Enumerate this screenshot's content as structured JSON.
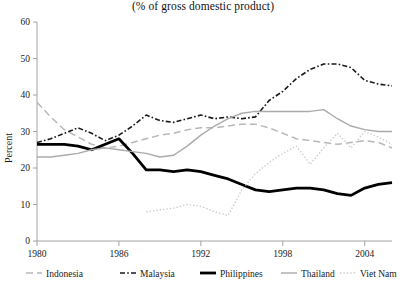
{
  "chart": {
    "title": "(% of gross domestic product)",
    "ylabel": "Percent"
  },
  "axes": {
    "y_ticks": [
      "0",
      "10",
      "20",
      "30",
      "40",
      "50",
      "60"
    ],
    "x_ticks": [
      "1980",
      "1986",
      "1992",
      "1998",
      "2004"
    ]
  },
  "legend": {
    "items": [
      {
        "label": "Indonesia",
        "key": "indonesia"
      },
      {
        "label": "Malaysia",
        "key": "malaysia"
      },
      {
        "label": "Philippines",
        "key": "philippines"
      },
      {
        "label": "Thailand",
        "key": "thailand"
      },
      {
        "label": "Viet Nam",
        "key": "vietnam"
      }
    ]
  },
  "chart_data": {
    "type": "line",
    "title": "(% of gross domestic product)",
    "xlabel": "",
    "ylabel": "Percent",
    "xlim": [
      1980,
      2006
    ],
    "ylim": [
      0,
      60
    ],
    "grid": false,
    "legend_position": "bottom",
    "x": [
      1980,
      1981,
      1982,
      1983,
      1984,
      1985,
      1986,
      1987,
      1988,
      1989,
      1990,
      1991,
      1992,
      1993,
      1994,
      1995,
      1996,
      1997,
      1998,
      1999,
      2000,
      2001,
      2002,
      2003,
      2004,
      2005,
      2006
    ],
    "series": [
      {
        "name": "Indonesia",
        "color": "#b8b8b8",
        "style": "dashed",
        "width": 1.5,
        "values": [
          38.0,
          34.0,
          30.5,
          28.5,
          26.5,
          25.5,
          26.0,
          27.0,
          28.0,
          29.0,
          29.5,
          30.5,
          31.0,
          31.0,
          31.5,
          32.0,
          32.0,
          31.0,
          29.5,
          28.0,
          27.5,
          27.0,
          26.5,
          27.0,
          27.5,
          27.0,
          25.5
        ]
      },
      {
        "name": "Malaysia",
        "color": "#1a1a1a",
        "style": "dashdot",
        "width": 1.6,
        "values": [
          27.0,
          28.0,
          29.5,
          31.0,
          29.5,
          27.5,
          29.0,
          31.5,
          34.5,
          33.0,
          32.5,
          33.5,
          34.5,
          33.5,
          34.0,
          33.5,
          34.0,
          38.5,
          41.0,
          44.5,
          47.0,
          48.5,
          48.5,
          47.5,
          44.0,
          43.0,
          42.5
        ]
      },
      {
        "name": "Philippines",
        "color": "#000000",
        "style": "solid",
        "width": 2.8,
        "values": [
          26.5,
          26.5,
          26.5,
          26.0,
          25.0,
          26.5,
          28.0,
          24.0,
          19.5,
          19.5,
          19.0,
          19.5,
          19.0,
          18.0,
          17.0,
          15.5,
          14.0,
          13.5,
          14.0,
          14.5,
          14.5,
          14.0,
          13.0,
          12.5,
          14.5,
          15.5,
          16.0
        ]
      },
      {
        "name": "Thailand",
        "color": "#aaaaaa",
        "style": "solid",
        "width": 1.4,
        "values": [
          23.0,
          23.0,
          23.5,
          24.0,
          25.0,
          25.5,
          25.0,
          24.5,
          24.0,
          23.0,
          23.5,
          26.0,
          29.0,
          31.5,
          33.5,
          35.0,
          35.5,
          35.5,
          35.5,
          35.5,
          35.5,
          36.0,
          33.5,
          31.5,
          30.5,
          30.0,
          30.0
        ]
      },
      {
        "name": "Viet Nam",
        "color": "#cccccc",
        "style": "dotted",
        "width": 1.4,
        "values": [
          null,
          null,
          null,
          null,
          null,
          null,
          null,
          null,
          8.0,
          8.5,
          9.0,
          10.0,
          9.5,
          8.0,
          7.0,
          14.0,
          18.5,
          21.5,
          24.0,
          26.0,
          21.0,
          25.5,
          29.5,
          25.5,
          30.0,
          28.5,
          26.5
        ]
      }
    ]
  }
}
